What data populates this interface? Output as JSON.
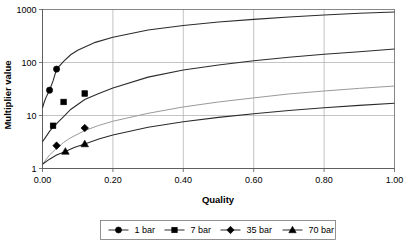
{
  "chart_data": {
    "type": "line",
    "title": "",
    "xlabel": "Quality",
    "ylabel": "Multiplier value",
    "xlim": [
      0.0,
      1.0
    ],
    "ylim": [
      1,
      1000
    ],
    "yscale": "log",
    "grid": true,
    "legend_position": "bottom",
    "xticks": [
      "0.00",
      "0.20",
      "0.40",
      "0.60",
      "0.80",
      "1.00"
    ],
    "xtick_values": [
      0.0,
      0.2,
      0.4,
      0.6,
      0.8,
      1.0
    ],
    "yticks": [
      "1000",
      "100",
      "10",
      "1"
    ],
    "ytick_values": [
      1000,
      100,
      10,
      1
    ],
    "series": [
      {
        "name": "1 bar",
        "marker": "circle",
        "stroke": "#2b2b2b",
        "line_x": [
          0.0,
          0.005,
          0.01,
          0.02,
          0.03,
          0.04,
          0.06,
          0.08,
          0.1,
          0.15,
          0.2,
          0.3,
          0.4,
          0.5,
          0.6,
          0.7,
          0.8,
          0.9,
          1.0
        ],
        "line_y": [
          14,
          18,
          22,
          30,
          45,
          75,
          105,
          140,
          170,
          240,
          300,
          410,
          500,
          580,
          650,
          720,
          790,
          850,
          900
        ],
        "points_x": [
          0.02,
          0.04
        ],
        "points_y": [
          30,
          75
        ]
      },
      {
        "name": "7 bar",
        "marker": "square",
        "stroke": "#2b2b2b",
        "line_x": [
          0.0,
          0.01,
          0.02,
          0.03,
          0.045,
          0.06,
          0.08,
          0.12,
          0.16,
          0.2,
          0.3,
          0.4,
          0.5,
          0.6,
          0.7,
          0.8,
          0.9,
          1.0
        ],
        "line_y": [
          3.2,
          4.0,
          5.0,
          6.0,
          7.6,
          9.5,
          13.0,
          20.0,
          26.0,
          33.0,
          53.0,
          72.0,
          90.0,
          108.0,
          126.0,
          143.0,
          160.0,
          180.0
        ],
        "points_x": [
          0.03,
          0.06,
          0.12
        ],
        "points_y": [
          6.4,
          18.0,
          26.0
        ]
      },
      {
        "name": "35 bar",
        "marker": "diamond",
        "stroke": "#9a9a9a",
        "line_x": [
          0.0,
          0.02,
          0.04,
          0.06,
          0.08,
          0.12,
          0.16,
          0.2,
          0.3,
          0.4,
          0.5,
          0.6,
          0.7,
          0.8,
          0.9,
          1.0
        ],
        "line_y": [
          1.2,
          1.8,
          2.4,
          3.1,
          3.8,
          5.2,
          6.5,
          7.8,
          11.0,
          14.5,
          18.0,
          21.5,
          25.5,
          29.0,
          32.5,
          36.0
        ],
        "points_x": [
          0.04,
          0.12
        ],
        "points_y": [
          2.7,
          5.8
        ]
      },
      {
        "name": "70 bar",
        "marker": "triangle",
        "stroke": "#2b2b2b",
        "line_x": [
          0.0,
          0.02,
          0.04,
          0.065,
          0.09,
          0.12,
          0.16,
          0.2,
          0.3,
          0.4,
          0.5,
          0.6,
          0.7,
          0.8,
          0.9,
          1.0
        ],
        "line_y": [
          1.2,
          1.5,
          1.8,
          2.1,
          2.5,
          2.9,
          3.6,
          4.3,
          6.0,
          7.6,
          9.2,
          10.8,
          12.4,
          14.0,
          15.5,
          17.0
        ],
        "points_x": [
          0.065,
          0.12
        ],
        "points_y": [
          2.1,
          2.9
        ]
      }
    ]
  },
  "legend": {
    "entries": [
      {
        "label": "1 bar",
        "marker": "circle"
      },
      {
        "label": "7 bar",
        "marker": "square"
      },
      {
        "label": "35 bar",
        "marker": "diamond"
      },
      {
        "label": "70 bar",
        "marker": "triangle"
      }
    ]
  }
}
